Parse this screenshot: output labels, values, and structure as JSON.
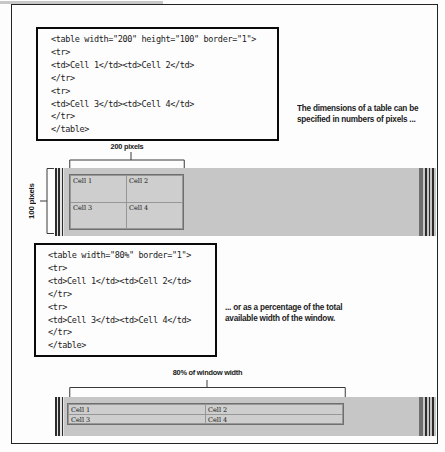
{
  "example1": {
    "code_lines": [
      "<table width=\"200\" height=\"100\" border=\"1\">",
      "<tr>",
      "<td>Cell 1</td><td>Cell 2</td>",
      "</tr>",
      "<tr>",
      "<td>Cell 3</td><td>Cell 4</td>",
      "</tr>",
      "</table>"
    ],
    "caption_lines": [
      "The dimensions of a table can be",
      "specified in numbers of pixels ..."
    ],
    "width_label": "200 pixels",
    "height_label": "100 pixels",
    "cells": [
      "Cell 1",
      "Cell 2",
      "Cell 3",
      "Cell 4"
    ]
  },
  "example2": {
    "code_lines": [
      "<table width=\"80%\" border=\"1\">",
      "<tr>",
      "<td>Cell 1</td><td>Cell 2</td>",
      "</tr>",
      "<tr>",
      "<td>Cell 3</td><td>Cell 4</td>",
      "</tr>",
      "</table>"
    ],
    "caption_lines": [
      "... or as a percentage of the total",
      "available width of the window."
    ],
    "width_label": "80% of window width",
    "cells": [
      "Cell 1",
      "Cell 2",
      "Cell 3",
      "Cell 4"
    ]
  },
  "colors": {
    "window_gray": "#c6c6c6",
    "table_cell_gray": "#cecece",
    "table_grid": "#979797",
    "scrollbar_dark": "#6e6e6e",
    "frame_border": "#232323",
    "code_box_border": "#0a0a0a"
  }
}
